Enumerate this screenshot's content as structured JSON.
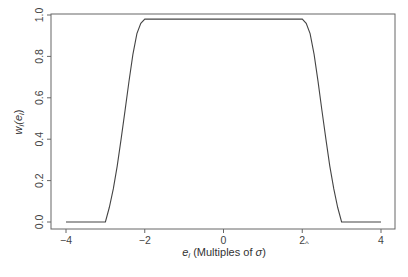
{
  "chart_data": {
    "type": "line",
    "title": "",
    "xlabel": "e_i (Multiples of σ̂)",
    "ylabel": "w_i(e_i)",
    "xlabel_parts": {
      "var": "e",
      "sub": "i",
      "text": " (Multiples of ",
      "sigma": "σ",
      "close": ")"
    },
    "ylabel_parts": {
      "var": "w",
      "sub": "i",
      "open": "(e",
      "sub2": "i",
      "close": ")"
    },
    "xlim": [
      -4,
      4
    ],
    "ylim": [
      0,
      1
    ],
    "x_ticks": [
      -4,
      -2,
      0,
      2,
      4
    ],
    "x_tick_labels": [
      "−4",
      "−2",
      "0",
      "2",
      "4"
    ],
    "y_ticks": [
      0.0,
      0.2,
      0.4,
      0.6,
      0.8,
      1.0
    ],
    "y_tick_labels": [
      "0.0",
      "0.2",
      "0.4",
      "0.6",
      "0.8",
      "1.0"
    ],
    "grid": false,
    "legend": null,
    "series": [
      {
        "name": "weight function",
        "x": [
          -4.0,
          -3.5,
          -3.0,
          -2.9,
          -2.8,
          -2.7,
          -2.6,
          -2.5,
          -2.4,
          -2.3,
          -2.2,
          -2.1,
          -2.0,
          -1.0,
          0.0,
          1.0,
          2.0,
          2.1,
          2.2,
          2.3,
          2.4,
          2.5,
          2.6,
          2.7,
          2.8,
          2.9,
          3.0,
          3.5,
          4.0
        ],
        "y": [
          0.0,
          0.0,
          0.0,
          0.07,
          0.16,
          0.27,
          0.4,
          0.54,
          0.68,
          0.81,
          0.91,
          0.96,
          0.98,
          0.98,
          0.98,
          0.98,
          0.98,
          0.96,
          0.91,
          0.81,
          0.68,
          0.54,
          0.4,
          0.27,
          0.16,
          0.07,
          0.0,
          0.0,
          0.0
        ]
      }
    ]
  }
}
